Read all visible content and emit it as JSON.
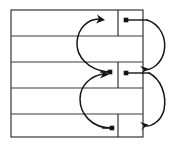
{
  "diagram": {
    "type": "pointer-linkage",
    "canvas": {
      "width": 179,
      "height": 146
    },
    "colors": {
      "background": "#ffffff",
      "outline": "#231f20",
      "row_rule": "#3c3a3b",
      "link": "#161415",
      "dot": "#141212"
    },
    "table": {
      "left": 11,
      "right": 143,
      "top": 10,
      "bottom": 137,
      "row_count": 5,
      "divider_x": 118,
      "rows": [
        {
          "index": 1,
          "top": 10,
          "bottom": 36,
          "split": true,
          "label": ""
        },
        {
          "index": 2,
          "top": 36,
          "bottom": 62,
          "split": false,
          "label": ""
        },
        {
          "index": 3,
          "top": 62,
          "bottom": 88,
          "split": true,
          "label": ""
        },
        {
          "index": 4,
          "top": 88,
          "bottom": 114,
          "split": false,
          "label": ""
        },
        {
          "index": 5,
          "top": 114,
          "bottom": 137,
          "split": true,
          "label": ""
        }
      ]
    },
    "nodes": [
      {
        "id": "dot-row1-right",
        "x": 126,
        "y": 20,
        "row": 1,
        "side": "right"
      },
      {
        "id": "dot-row3-left",
        "x": 110,
        "y": 72,
        "row": 3,
        "side": "left"
      },
      {
        "id": "dot-row3-right",
        "x": 126,
        "y": 73,
        "row": 3,
        "side": "right"
      },
      {
        "id": "dot-row5-left",
        "x": 112,
        "y": 128,
        "row": 5,
        "side": "left"
      }
    ],
    "links": [
      {
        "id": "link-left-upper",
        "from": "dot-row3-left",
        "to": "row1-interior",
        "side": "left",
        "direction": "up",
        "arrow_at": {
          "x": 101,
          "y": 20
        }
      },
      {
        "id": "link-left-lower",
        "from": "dot-row5-left",
        "to": "dot-row3-left",
        "side": "left",
        "direction": "up",
        "arrow_at": {
          "x": 106,
          "y": 74
        }
      },
      {
        "id": "link-right-upper",
        "from": "dot-row1-right",
        "to": "dot-row3-right",
        "side": "right",
        "direction": "down",
        "arrow_at": {
          "x": 142,
          "y": 70
        }
      },
      {
        "id": "link-right-lower",
        "from": "dot-row3-right",
        "to": "row5-right",
        "side": "right",
        "direction": "down",
        "arrow_at": {
          "x": 142,
          "y": 126
        }
      }
    ]
  }
}
